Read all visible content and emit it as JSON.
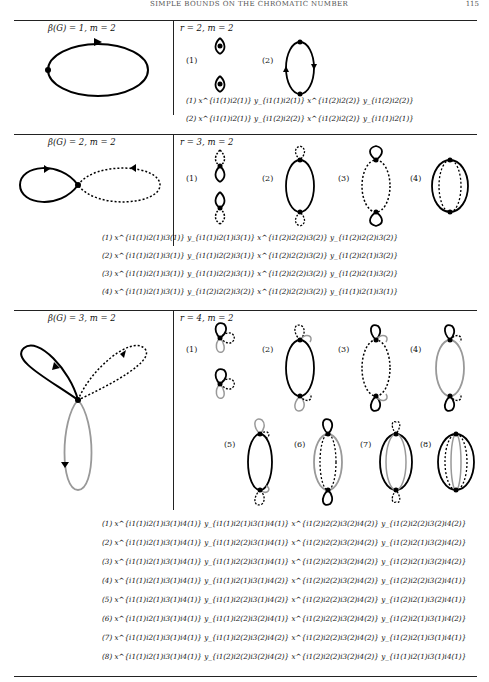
{
  "header": {
    "title": "SIMPLE BOUNDS ON THE CHROMATIC NUMBER",
    "page_number": "115"
  },
  "rows": [
    {
      "left_label": "β(G) = 1, m = 2",
      "right_label": "r = 2, m = 2",
      "diagram_labels": [
        "(1)",
        "(2)"
      ],
      "formulas": [
        "(1) x^{i1(1)i2(1)} y_{i1(1)i2(1)} x^{i1(2)i2(2)} y_{i1(2)i2(2)}",
        "(2) x^{i1(1)i2(1)} y_{i1(2)i2(2)} x^{i1(2)i2(2)} y_{i1(1)i2(1)}"
      ]
    },
    {
      "left_label": "β(G) = 2, m = 2",
      "right_label": "r = 3, m = 2",
      "diagram_labels": [
        "(1)",
        "(2)",
        "(3)",
        "(4)"
      ],
      "formulas": [
        "(1) x^{i1(1)i2(1)i3(1)} y_{i1(1)i2(1)i3(1)} x^{i1(2)i2(2)i3(2)} y_{i1(2)i2(2)i3(2)}",
        "(2) x^{i1(1)i2(1)i3(1)} y_{i1(1)i2(2)i3(1)} x^{i1(2)i2(2)i3(2)} y_{i1(2)i2(1)i3(2)}",
        "(3) x^{i1(1)i2(1)i3(1)} y_{i1(1)i2(2)i3(1)} x^{i1(2)i2(2)i3(2)} y_{i1(2)i2(1)i3(2)}",
        "(4) x^{i1(1)i2(1)i3(1)} y_{i1(2)i2(2)i3(2)} x^{i1(2)i2(2)i3(2)} y_{i1(1)i2(1)i3(1)}"
      ]
    },
    {
      "left_label": "β(G) = 3, m = 2",
      "right_label": "r = 4, m = 2",
      "diagram_labels": [
        "(1)",
        "(2)",
        "(3)",
        "(4)",
        "(5)",
        "(6)",
        "(7)",
        "(8)"
      ],
      "formulas": [
        "(1) x^{i1(1)i2(1)i3(1)i4(1)} y_{i1(1)i2(1)i3(1)i4(1)} x^{i1(2)i2(2)i3(2)i4(2)} y_{i1(2)i2(2)i3(2)i4(2)}",
        "(2) x^{i1(1)i2(1)i3(1)i4(1)} y_{i1(1)i2(2)i3(1)i4(1)} x^{i1(2)i2(2)i3(2)i4(2)} y_{i1(2)i2(1)i3(2)i4(2)}",
        "(3) x^{i1(1)i2(1)i3(1)i4(1)} y_{i1(1)i2(2)i3(1)i4(1)} x^{i1(2)i2(2)i3(2)i4(2)} y_{i1(2)i2(1)i3(2)i4(2)}",
        "(4) x^{i1(1)i2(1)i3(1)i4(1)} y_{i1(1)i2(1)i3(1)i4(2)} x^{i1(2)i2(2)i3(2)i4(2)} y_{i1(2)i2(2)i3(2)i4(1)}",
        "(5) x^{i1(1)i2(1)i3(1)i4(1)} y_{i1(1)i2(2)i3(1)i4(2)} x^{i1(2)i2(2)i3(2)i4(2)} y_{i1(2)i2(1)i3(2)i4(1)}",
        "(6) x^{i1(1)i2(1)i3(1)i4(1)} y_{i1(1)i2(2)i3(2)i4(1)} x^{i1(2)i2(2)i3(2)i4(2)} y_{i1(2)i2(1)i3(1)i4(2)}",
        "(7) x^{i1(1)i2(1)i3(1)i4(1)} y_{i1(1)i2(2)i3(2)i4(2)} x^{i1(2)i2(2)i3(2)i4(2)} y_{i1(2)i2(1)i3(1)i4(1)}",
        "(8) x^{i1(1)i2(1)i3(1)i4(1)} y_{i1(2)i2(2)i3(2)i4(2)} x^{i1(2)i2(2)i3(2)i4(2)} y_{i1(1)i2(1)i3(1)i4(1)}"
      ]
    }
  ]
}
